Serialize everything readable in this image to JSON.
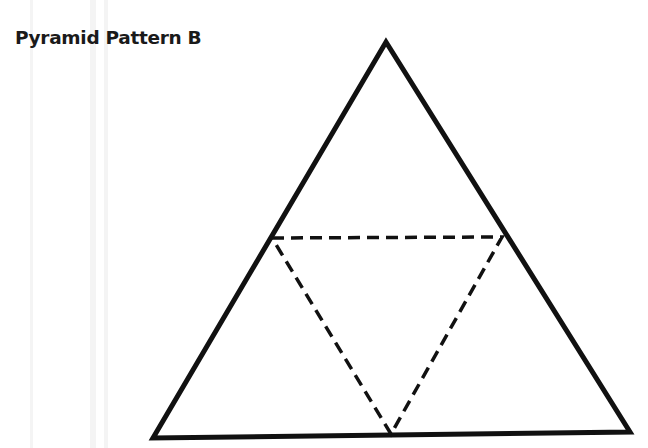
{
  "title": "Pyramid Pattern B",
  "diagram": {
    "outer_triangle": {
      "apex": [
        386,
        42
      ],
      "bottom_left": [
        153,
        438
      ],
      "bottom_right": [
        630,
        432
      ],
      "stroke": "#111111",
      "stroke_width": 5
    },
    "inner_triangle_dashed": {
      "left_mid": [
        272,
        238
      ],
      "right_mid": [
        502,
        237
      ],
      "bottom_mid": [
        391,
        434
      ],
      "stroke": "#111111",
      "stroke_width": 3.5,
      "dash": "12 7"
    }
  }
}
